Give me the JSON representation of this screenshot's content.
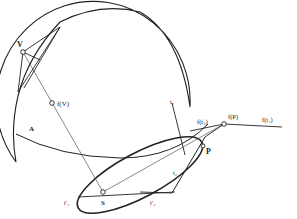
{
  "diagram": {
    "labels": {
      "V": "V",
      "fV": "f(V)",
      "A": "A",
      "S": "S",
      "P": "P",
      "t1": "t₁",
      "t2": "t₂",
      "t1p": "t′₁",
      "t2p": "t′₂",
      "ft1": "f(t₁)",
      "fP": "f(P)",
      "ft2": "f(t₂)"
    },
    "colors": {
      "stroke": "#222222",
      "thin": "#555555",
      "background": "#ffffff"
    }
  }
}
